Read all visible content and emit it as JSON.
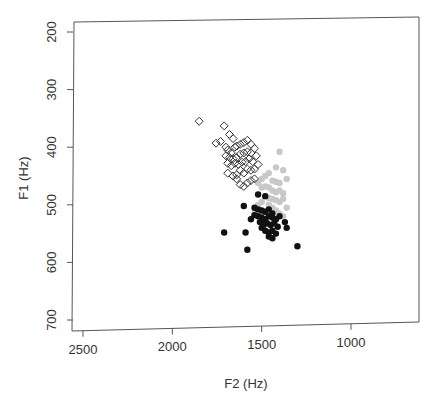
{
  "chart_data": {
    "type": "scatter",
    "title": "",
    "xlabel": "F2 (Hz)",
    "ylabel": "F1 (Hz)",
    "xlim": [
      2550,
      650
    ],
    "ylim": [
      720,
      180
    ],
    "x_reversed": true,
    "y_reversed": true,
    "x_ticks": [
      2500,
      2000,
      1500,
      1000
    ],
    "y_ticks": [
      200,
      300,
      400,
      500,
      600,
      700
    ],
    "grid": false,
    "legend": null,
    "series": [
      {
        "name": "open-diamond",
        "marker": "diamond-open",
        "color": "#333333",
        "points": [
          [
            1850,
            355
          ],
          [
            1710,
            363
          ],
          [
            1755,
            393
          ],
          [
            1730,
            390
          ],
          [
            1680,
            378
          ],
          [
            1660,
            385
          ],
          [
            1700,
            400
          ],
          [
            1690,
            405
          ],
          [
            1670,
            410
          ],
          [
            1650,
            400
          ],
          [
            1640,
            398
          ],
          [
            1620,
            395
          ],
          [
            1600,
            392
          ],
          [
            1580,
            388
          ],
          [
            1560,
            395
          ],
          [
            1700,
            415
          ],
          [
            1680,
            418
          ],
          [
            1660,
            420
          ],
          [
            1640,
            418
          ],
          [
            1620,
            412
          ],
          [
            1600,
            410
          ],
          [
            1580,
            408
          ],
          [
            1560,
            410
          ],
          [
            1540,
            402
          ],
          [
            1530,
            415
          ],
          [
            1690,
            428
          ],
          [
            1670,
            432
          ],
          [
            1650,
            428
          ],
          [
            1630,
            430
          ],
          [
            1610,
            426
          ],
          [
            1590,
            425
          ],
          [
            1570,
            420
          ],
          [
            1550,
            425
          ],
          [
            1690,
            445
          ],
          [
            1660,
            450
          ],
          [
            1640,
            448
          ],
          [
            1620,
            440
          ],
          [
            1600,
            445
          ],
          [
            1580,
            438
          ],
          [
            1560,
            440
          ],
          [
            1540,
            438
          ],
          [
            1620,
            465
          ],
          [
            1600,
            468
          ],
          [
            1580,
            462
          ],
          [
            1560,
            458
          ],
          [
            1540,
            455
          ],
          [
            1640,
            455
          ],
          [
            1520,
            430
          ]
        ]
      },
      {
        "name": "gray-filled",
        "marker": "circle-filled",
        "color": "#c8c8c8",
        "points": [
          [
            1400,
            408
          ],
          [
            1420,
            435
          ],
          [
            1380,
            440
          ],
          [
            1360,
            455
          ],
          [
            1460,
            445
          ],
          [
            1480,
            450
          ],
          [
            1500,
            455
          ],
          [
            1440,
            458
          ],
          [
            1420,
            460
          ],
          [
            1400,
            462
          ],
          [
            1520,
            462
          ],
          [
            1500,
            470
          ],
          [
            1480,
            468
          ],
          [
            1460,
            470
          ],
          [
            1440,
            475
          ],
          [
            1420,
            478
          ],
          [
            1400,
            475
          ],
          [
            1380,
            480
          ],
          [
            1480,
            485
          ],
          [
            1460,
            488
          ],
          [
            1440,
            490
          ],
          [
            1420,
            492
          ],
          [
            1400,
            495
          ],
          [
            1380,
            490
          ],
          [
            1500,
            495
          ],
          [
            1520,
            500
          ],
          [
            1460,
            500
          ],
          [
            1440,
            505
          ],
          [
            1420,
            510
          ],
          [
            1360,
            505
          ],
          [
            1480,
            512
          ],
          [
            1400,
            515
          ],
          [
            1380,
            520
          ],
          [
            1540,
            515
          ]
        ]
      },
      {
        "name": "black-filled",
        "marker": "circle-filled",
        "color": "#111111",
        "points": [
          [
            1520,
            482
          ],
          [
            1480,
            485
          ],
          [
            1600,
            502
          ],
          [
            1540,
            505
          ],
          [
            1520,
            508
          ],
          [
            1500,
            510
          ],
          [
            1480,
            512
          ],
          [
            1460,
            508
          ],
          [
            1440,
            515
          ],
          [
            1540,
            518
          ],
          [
            1520,
            520
          ],
          [
            1500,
            522
          ],
          [
            1480,
            525
          ],
          [
            1460,
            520
          ],
          [
            1440,
            522
          ],
          [
            1420,
            525
          ],
          [
            1400,
            520
          ],
          [
            1560,
            525
          ],
          [
            1510,
            530
          ],
          [
            1490,
            535
          ],
          [
            1470,
            532
          ],
          [
            1450,
            535
          ],
          [
            1430,
            532
          ],
          [
            1410,
            538
          ],
          [
            1370,
            530
          ],
          [
            1360,
            540
          ],
          [
            1500,
            540
          ],
          [
            1480,
            545
          ],
          [
            1460,
            548
          ],
          [
            1440,
            545
          ],
          [
            1420,
            550
          ],
          [
            1460,
            555
          ],
          [
            1440,
            558
          ],
          [
            1710,
            548
          ],
          [
            1590,
            548
          ],
          [
            1580,
            578
          ],
          [
            1300,
            572
          ]
        ]
      }
    ]
  }
}
